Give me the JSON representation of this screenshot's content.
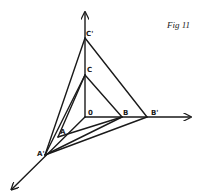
{
  "figure": {
    "title": "Fig  11",
    "labels": {
      "O": "0",
      "A": "A",
      "B": "B",
      "C": "C",
      "A_prime": "A'",
      "B_prime": "B'",
      "C_prime": "C'"
    },
    "line_color": "#1a1a1a",
    "background": "#ffffff"
  }
}
